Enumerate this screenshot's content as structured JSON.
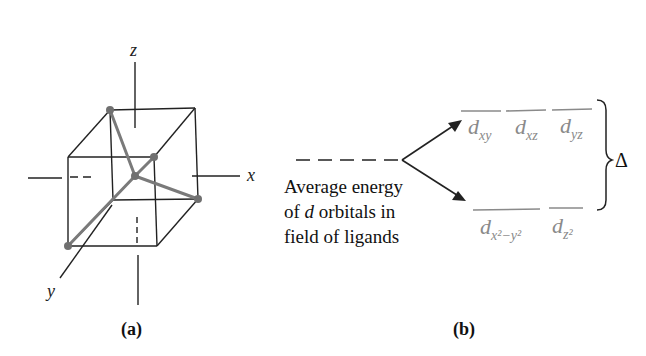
{
  "panel_a": {
    "label": "(a)",
    "axes": {
      "x": "x",
      "y": "y",
      "z": "z"
    },
    "ligand_color": "#7a7a7a",
    "edge_color": "#222222"
  },
  "panel_b": {
    "label": "(b)",
    "description_lines": [
      "Average energy",
      "of d orbitals in",
      "field of ligands"
    ],
    "upper_orbitals": [
      "xy",
      "xz",
      "yz"
    ],
    "lower_orbitals": [
      "x²−y²",
      "z²"
    ],
    "orbital_symbol": "d",
    "splitting_symbol": "Δ",
    "orbital_color": "#8a8a8a"
  }
}
